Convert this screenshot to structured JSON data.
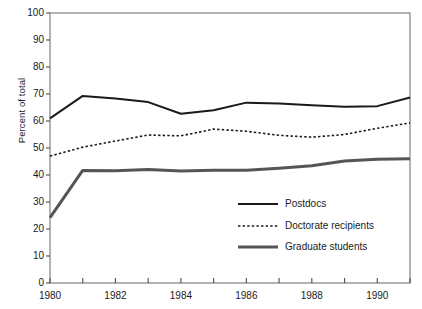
{
  "chart_data": {
    "type": "line",
    "title": "",
    "xlabel": "",
    "ylabel": "Percent of total",
    "xlim": [
      1980,
      1991
    ],
    "ylim": [
      0,
      100
    ],
    "grid": false,
    "legend_position": "inside-lower-right",
    "x": [
      1980,
      1981,
      1982,
      1983,
      1984,
      1985,
      1986,
      1987,
      1988,
      1989,
      1990,
      1991
    ],
    "xtick_values": [
      1980,
      1981,
      1982,
      1983,
      1984,
      1985,
      1986,
      1987,
      1988,
      1989,
      1990,
      1991
    ],
    "xtick_labels": [
      "1980",
      "",
      "1982",
      "",
      "1984",
      "",
      "1986",
      "",
      "1988",
      "",
      "1990",
      ""
    ],
    "ytick_values": [
      0,
      10,
      20,
      30,
      40,
      50,
      60,
      70,
      80,
      90,
      100
    ],
    "ytick_labels": [
      "0",
      "10",
      "20",
      "30",
      "40",
      "50",
      "60",
      "70",
      "80",
      "90",
      "100"
    ],
    "series": [
      {
        "name": "Postdocs",
        "style": "solid",
        "color": "#1a1a1a",
        "width": 2.0,
        "values": [
          61.0,
          69.3,
          68.3,
          67.0,
          62.7,
          64.0,
          66.8,
          66.5,
          65.8,
          65.3,
          65.5,
          68.7
        ]
      },
      {
        "name": "Doctorate recipients",
        "style": "dashed",
        "color": "#1a1a1a",
        "width": 1.6,
        "values": [
          47.0,
          50.3,
          52.6,
          54.8,
          54.5,
          57.0,
          56.2,
          54.7,
          54.0,
          55.0,
          57.3,
          59.3
        ]
      },
      {
        "name": "Graduate students",
        "style": "solid",
        "color": "#555555",
        "width": 3.0,
        "values": [
          24.2,
          41.7,
          41.6,
          42.0,
          41.5,
          41.8,
          41.8,
          42.5,
          43.4,
          45.2,
          45.8,
          46.0
        ]
      }
    ]
  },
  "legend": {
    "entries": [
      {
        "label": "Postdocs"
      },
      {
        "label": "Doctorate recipients"
      },
      {
        "label": "Graduate students"
      }
    ]
  },
  "axes": {
    "frame_color": "#808080",
    "tick_color": "#4d4d4d"
  }
}
